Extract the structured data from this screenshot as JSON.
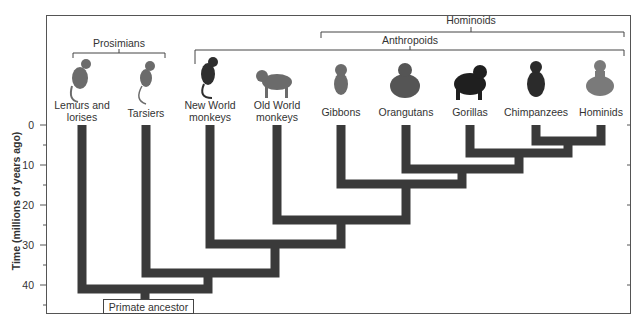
{
  "groups": {
    "prosimians": "Prosimians",
    "anthropoids": "Anthropoids",
    "hominoids": "Hominoids"
  },
  "taxa": [
    {
      "line1": "Lemurs and",
      "line2": "lorises",
      "icon": "lemur-icon"
    },
    {
      "line1": "Tarsiers",
      "line2": "",
      "icon": "tarsier-icon"
    },
    {
      "line1": "New World",
      "line2": "monkeys",
      "icon": "new-world-monkey-icon"
    },
    {
      "line1": "Old World",
      "line2": "monkeys",
      "icon": "old-world-monkey-icon"
    },
    {
      "line1": "Gibbons",
      "line2": "",
      "icon": "gibbon-icon"
    },
    {
      "line1": "Orangutans",
      "line2": "",
      "icon": "orangutan-icon"
    },
    {
      "line1": "Gorillas",
      "line2": "",
      "icon": "gorilla-icon"
    },
    {
      "line1": "Chimpanzees",
      "line2": "",
      "icon": "chimpanzee-icon"
    },
    {
      "line1": "Hominids",
      "line2": "",
      "icon": "human-icon"
    }
  ],
  "axis": {
    "title": "Time (millions of years ago)",
    "ticks": [
      "0",
      "10",
      "20",
      "30",
      "40"
    ]
  },
  "root_label": "Primate ancestor",
  "divergence_mya": {
    "chimpanzees_hominids": 4,
    "gorillas": 7,
    "orangutans": 11,
    "gibbons": 15,
    "old_world_monkeys": 24,
    "new_world_monkeys": 30,
    "tarsiers": 37,
    "lemurs_and_lorises": 41
  },
  "colors": {
    "branch": "#3a3a3a",
    "text": "#333333"
  }
}
